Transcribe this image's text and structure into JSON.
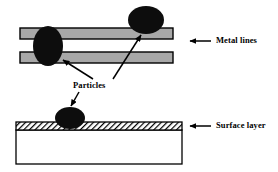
{
  "figure": {
    "background_color": "#ffffff"
  },
  "labels": {
    "metal_lines": "Metal lines",
    "surface_layer": "Surface layer",
    "particles": "Particles"
  },
  "colors": {
    "metal_fill": "#a8a8a8",
    "metal_stroke": "#000000",
    "particle_fill": "#0d0d0d",
    "substrate_fill": "#ffffff",
    "substrate_stroke": "#000000",
    "hatch_stroke": "#000000",
    "leader_line": "#000000",
    "text": "#000000"
  },
  "structures": {
    "metal_lines": [
      {
        "name": "upper-metal-line",
        "x": 20,
        "y": 28,
        "width": 153,
        "height": 11
      },
      {
        "name": "lower-metal-line",
        "x": 20,
        "y": 52,
        "width": 153,
        "height": 11
      }
    ],
    "surface_layer": {
      "name": "hatched-surface-layer",
      "x": 16,
      "y": 122,
      "width": 166,
      "height": 8
    },
    "substrate": {
      "name": "substrate-block",
      "x": 16,
      "y": 130,
      "width": 166,
      "height": 34
    }
  },
  "particles": [
    {
      "name": "particle-bridging-metal-lines",
      "cx": 48,
      "cy": 46,
      "rx": 15,
      "ry": 20
    },
    {
      "name": "particle-on-upper-metal-line",
      "cx": 146,
      "cy": 20,
      "rx": 18,
      "ry": 14
    },
    {
      "name": "particle-on-surface-layer",
      "cx": 70,
      "cy": 118,
      "rx": 15,
      "ry": 11
    }
  ],
  "callout_arrows": [
    {
      "name": "arrow-to-metal-lines",
      "from_x": 211,
      "from_y": 41,
      "to_x": 190,
      "to_y": 41
    },
    {
      "name": "arrow-to-surface-layer",
      "from_x": 211,
      "from_y": 126,
      "to_x": 190,
      "to_y": 126
    },
    {
      "name": "arrow-to-particle-bridging",
      "from_x": 93,
      "from_y": 79,
      "to_x": 62,
      "to_y": 59
    },
    {
      "name": "arrow-to-particle-on-metal",
      "from_x": 113,
      "from_y": 79,
      "to_x": 141,
      "to_y": 34
    },
    {
      "name": "arrow-to-particle-on-surface",
      "from_x": 78,
      "from_y": 92,
      "to_x": 70,
      "to_y": 107
    }
  ]
}
